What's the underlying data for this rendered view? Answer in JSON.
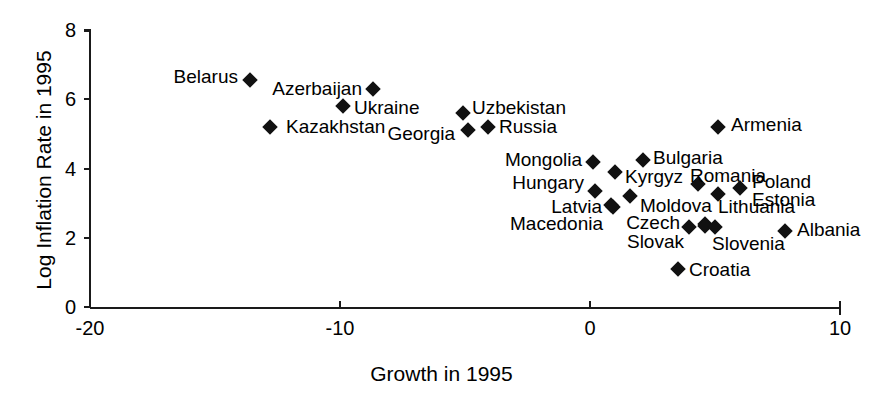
{
  "chart_data": {
    "type": "scatter",
    "title": "",
    "xlabel": "Growth in 1995",
    "ylabel": "Log Inflation Rate in 1995",
    "xlim": [
      -20,
      10
    ],
    "ylim": [
      0,
      8
    ],
    "xticks": [
      -20,
      -10,
      0,
      10
    ],
    "yticks": [
      0,
      2,
      4,
      6,
      8
    ],
    "grid": false,
    "legend": "none",
    "marker": "filled-diamond",
    "marker_color": "#111111",
    "points": [
      {
        "label": "Belarus",
        "x": -13.6,
        "y": 6.55,
        "label_side": "left"
      },
      {
        "label": "Azerbaijan",
        "x": -8.7,
        "y": 6.3,
        "label_side": "left"
      },
      {
        "label": "Ukraine",
        "x": -9.9,
        "y": 5.8,
        "label_side": "right"
      },
      {
        "label": "Kazakhstan",
        "x": -12.8,
        "y": 5.2,
        "label_side": "right"
      },
      {
        "label": "Uzbekistan",
        "x": -5.1,
        "y": 5.6,
        "label_side": "right"
      },
      {
        "label": "Georgia",
        "x": -4.9,
        "y": 5.1,
        "label_side": "left"
      },
      {
        "label": "Russia",
        "x": -4.1,
        "y": 5.2,
        "label_side": "right"
      },
      {
        "label": "Armenia",
        "x": 5.1,
        "y": 5.2,
        "label_side": "right"
      },
      {
        "label": "Mongolia",
        "x": 0.1,
        "y": 4.2,
        "label_side": "left"
      },
      {
        "label": "Bulgaria",
        "x": 2.1,
        "y": 4.25,
        "label_side": "right"
      },
      {
        "label": "Kyrgyz",
        "x": 1.0,
        "y": 3.9,
        "label_side": "right"
      },
      {
        "label": "Hungary",
        "x": 0.2,
        "y": 3.35,
        "label_side": "left"
      },
      {
        "label": "Romania",
        "x": 4.3,
        "y": 3.55,
        "label_side": "right"
      },
      {
        "label": "Poland",
        "x": 6.0,
        "y": 3.45,
        "label_side": "right"
      },
      {
        "label": "Estonia",
        "x": 5.1,
        "y": 3.25,
        "label_side": "right"
      },
      {
        "label": "Moldova",
        "x": 1.6,
        "y": 3.2,
        "label_side": "right"
      },
      {
        "label": "Latvia",
        "x": 0.9,
        "y": 2.9,
        "label_side": "left"
      },
      {
        "label": "Macedonia",
        "x": 0.85,
        "y": 2.95,
        "label_side": "left"
      },
      {
        "label": "Lithuania",
        "x": 4.6,
        "y": 2.4,
        "label_side": "right"
      },
      {
        "label": "Czech",
        "x": 3.95,
        "y": 2.3,
        "label_side": "left"
      },
      {
        "label": "Slovak",
        "x": 4.6,
        "y": 2.35,
        "label_side": "left"
      },
      {
        "label": "Slovenia",
        "x": 5.0,
        "y": 2.3,
        "label_side": "right"
      },
      {
        "label": "Albania",
        "x": 7.8,
        "y": 2.2,
        "label_side": "right"
      },
      {
        "label": "Croatia",
        "x": 3.5,
        "y": 1.1,
        "label_side": "right"
      }
    ],
    "label_overrides": {
      "Belarus": {
        "lx": 238,
        "ly": 76,
        "side": "left"
      },
      "Azerbaijan": {
        "lx": 362,
        "ly": 88,
        "side": "left"
      },
      "Ukraine": {
        "lx": 354,
        "ly": 107,
        "side": "right"
      },
      "Kazakhstan": {
        "lx": 286,
        "ly": 126,
        "side": "right"
      },
      "Uzbekistan": {
        "lx": 472,
        "ly": 107,
        "side": "right"
      },
      "Georgia": {
        "lx": 455,
        "ly": 133,
        "side": "left"
      },
      "Russia": {
        "lx": 499,
        "ly": 126,
        "side": "right"
      },
      "Armenia": {
        "lx": 731,
        "ly": 124,
        "side": "right"
      },
      "Mongolia": {
        "lx": 582,
        "ly": 159,
        "side": "left"
      },
      "Bulgaria": {
        "lx": 653,
        "ly": 157,
        "side": "right"
      },
      "Kyrgyz": {
        "lx": 625,
        "ly": 176,
        "side": "right"
      },
      "Hungary": {
        "lx": 584,
        "ly": 182,
        "side": "left"
      },
      "Romania": {
        "lx": 690,
        "ly": 175,
        "side": "right"
      },
      "Poland": {
        "lx": 752,
        "ly": 181,
        "side": "right"
      },
      "Estonia": {
        "lx": 752,
        "ly": 199,
        "side": "right"
      },
      "Moldova": {
        "lx": 640,
        "ly": 205,
        "side": "right"
      },
      "Latvia": {
        "lx": 602,
        "ly": 206,
        "side": "left"
      },
      "Macedonia": {
        "lx": 603,
        "ly": 223,
        "side": "left"
      },
      "Lithuania": {
        "lx": 718,
        "ly": 206,
        "side": "right"
      },
      "Czech": {
        "lx": 680,
        "ly": 222,
        "side": "left"
      },
      "Slovak": {
        "lx": 684,
        "ly": 241,
        "side": "left"
      },
      "Slovenia": {
        "lx": 712,
        "ly": 243,
        "side": "right"
      },
      "Albania": {
        "lx": 797,
        "ly": 229,
        "side": "right"
      },
      "Croatia": {
        "lx": 689,
        "ly": 269,
        "side": "right"
      }
    }
  }
}
